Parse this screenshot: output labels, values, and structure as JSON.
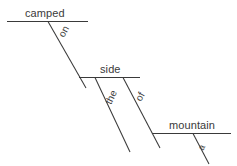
{
  "diagram": {
    "type": "reed-kellogg-sentence-diagram",
    "sentence": "camped on the side of a mountain",
    "canvas": {
      "width": 237,
      "height": 166,
      "background": "#ffffff"
    },
    "line_color": "#3a3a3a",
    "text_color": "#3a3a3a",
    "baselines": [
      {
        "id": "camped-baseline",
        "label": "camped",
        "x1": 7,
        "y1": 21.5,
        "x2": 88,
        "y2": 21.5
      },
      {
        "id": "side-baseline",
        "label": "side",
        "x1": 79,
        "y1": 77.5,
        "x2": 140,
        "y2": 77.5
      },
      {
        "id": "mountain-baseline",
        "label": "mountain",
        "x1": 152,
        "y1": 133.5,
        "x2": 231,
        "y2": 133.5
      }
    ],
    "slants": [
      {
        "id": "on-slant",
        "label": "on",
        "x1": 48,
        "y1": 21.5,
        "x2": 86,
        "y2": 88
      },
      {
        "id": "the-slant",
        "label": "the",
        "x1": 95,
        "y1": 77.5,
        "x2": 130,
        "y2": 152
      },
      {
        "id": "of-slant",
        "label": "of",
        "x1": 123,
        "y1": 77.5,
        "x2": 160,
        "y2": 148
      },
      {
        "id": "a-slant",
        "label": "a",
        "x1": 193,
        "y1": 133.5,
        "x2": 209,
        "y2": 164
      }
    ],
    "labels": {
      "camped": "camped",
      "on": "on",
      "side": "side",
      "the": "the",
      "of": "of",
      "mountain": "mountain",
      "a": "a"
    }
  }
}
